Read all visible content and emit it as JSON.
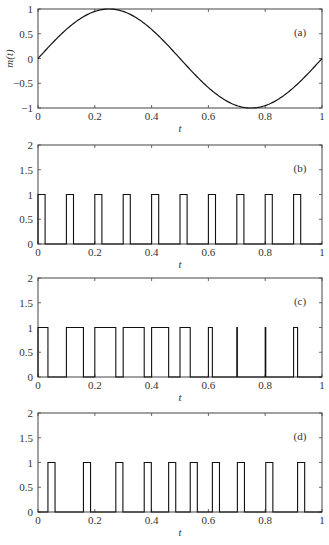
{
  "chart_data": [
    {
      "type": "line",
      "panel_label": "(a)",
      "title": "",
      "xlabel": "t",
      "ylabel": "m(t)",
      "xlim": [
        0,
        1
      ],
      "ylim": [
        -1,
        1
      ],
      "xticks": [
        "0",
        "0.2",
        "0.4",
        "0.6",
        "0.8",
        "1"
      ],
      "yticks": [
        "-1",
        "-0.5",
        "0",
        "0.5",
        "1"
      ],
      "grid": false,
      "series": [
        {
          "name": "m(t) = sin(2πt)",
          "function": "sin(2*pi*t)",
          "x": [
            0,
            0.05,
            0.1,
            0.15,
            0.2,
            0.25,
            0.3,
            0.35,
            0.4,
            0.45,
            0.5,
            0.55,
            0.6,
            0.65,
            0.7,
            0.75,
            0.8,
            0.85,
            0.9,
            0.95,
            1.0
          ],
          "y": [
            0,
            0.31,
            0.59,
            0.81,
            0.95,
            1.0,
            0.95,
            0.81,
            0.59,
            0.31,
            0,
            -0.31,
            -0.59,
            -0.81,
            -0.95,
            -1.0,
            -0.95,
            -0.81,
            -0.59,
            -0.31,
            0
          ]
        }
      ]
    },
    {
      "type": "line",
      "panel_label": "(b)",
      "xlabel": "t",
      "ylabel": "",
      "xlim": [
        0,
        1
      ],
      "ylim": [
        0,
        2
      ],
      "xticks": [
        "0",
        "0.2",
        "0.4",
        "0.6",
        "0.8",
        "1"
      ],
      "yticks": [
        "0",
        "0.5",
        "1",
        "1.5",
        "2"
      ],
      "grid": false,
      "series": [
        {
          "name": "unmodulated pulse train",
          "pulse_height": 1,
          "pulses": [
            [
              0.0,
              0.025
            ],
            [
              0.1,
              0.125
            ],
            [
              0.2,
              0.225
            ],
            [
              0.3,
              0.325
            ],
            [
              0.4,
              0.425
            ],
            [
              0.5,
              0.525
            ],
            [
              0.6,
              0.625
            ],
            [
              0.7,
              0.725
            ],
            [
              0.8,
              0.825
            ],
            [
              0.9,
              0.925
            ]
          ]
        }
      ]
    },
    {
      "type": "line",
      "panel_label": "(c)",
      "xlabel": "t",
      "ylabel": "",
      "xlim": [
        0,
        1
      ],
      "ylim": [
        0,
        2
      ],
      "xticks": [
        "0",
        "0.2",
        "0.4",
        "0.6",
        "0.8",
        "1"
      ],
      "yticks": [
        "0",
        "0.5",
        "1",
        "1.5",
        "2"
      ],
      "grid": false,
      "series": [
        {
          "name": "pulse-width modulated",
          "pulse_height": 1,
          "pulses": [
            [
              0.0,
              0.035
            ],
            [
              0.1,
              0.16
            ],
            [
              0.2,
              0.274
            ],
            [
              0.3,
              0.374
            ],
            [
              0.4,
              0.46
            ],
            [
              0.5,
              0.536
            ],
            [
              0.6,
              0.614
            ],
            [
              0.7,
              0.702
            ],
            [
              0.8,
              0.802
            ],
            [
              0.9,
              0.914
            ]
          ]
        }
      ]
    },
    {
      "type": "line",
      "panel_label": "(d)",
      "xlabel": "t",
      "ylabel": "",
      "xlim": [
        0,
        1
      ],
      "ylim": [
        0,
        2
      ],
      "xticks": [
        "0",
        "0.2",
        "0.4",
        "0.6",
        "0.8",
        "1"
      ],
      "yticks": [
        "0",
        "0.5",
        "1",
        "1.5",
        "2"
      ],
      "grid": false,
      "series": [
        {
          "name": "pulse-position modulated",
          "pulse_height": 1,
          "pulses": [
            [
              0.035,
              0.06
            ],
            [
              0.16,
              0.185
            ],
            [
              0.274,
              0.299
            ],
            [
              0.374,
              0.399
            ],
            [
              0.46,
              0.485
            ],
            [
              0.536,
              0.561
            ],
            [
              0.614,
              0.639
            ],
            [
              0.702,
              0.727
            ],
            [
              0.802,
              0.827
            ],
            [
              0.914,
              0.939
            ]
          ]
        }
      ]
    }
  ],
  "layout": {
    "plot_left": 38,
    "plot_width": 284,
    "plot_height": 99,
    "panel_tops": [
      9,
      145,
      278,
      413
    ]
  }
}
